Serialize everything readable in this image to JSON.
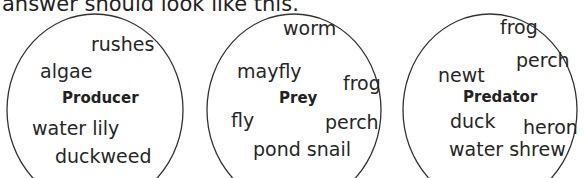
{
  "caption": "answer should look like this.",
  "circles": [
    {
      "label": "Producer",
      "words": [
        "rushes",
        "algae",
        "water lily",
        "duckweed"
      ]
    },
    {
      "label": "Prey",
      "words": [
        "worm",
        "mayfly",
        "frog",
        "fly",
        "perch",
        "pond snail"
      ]
    },
    {
      "label": "Predator",
      "words": [
        "frog",
        "perch",
        "newt",
        "duck",
        "heron",
        "water shrew"
      ]
    }
  ]
}
